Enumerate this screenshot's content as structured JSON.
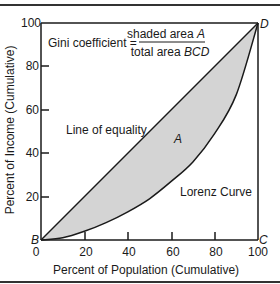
{
  "chart_data": {
    "type": "area",
    "title": "",
    "xlabel": "Percent of Population (Cumulative)",
    "ylabel": "Percent of Income (Cumulative)",
    "xlim": [
      0,
      100
    ],
    "ylim": [
      0,
      100
    ],
    "x_ticks": [
      "0",
      "20",
      "40",
      "60",
      "80",
      "100"
    ],
    "y_ticks": [
      "20",
      "40",
      "60",
      "80",
      "100"
    ],
    "grid": false,
    "legend": "none",
    "series": [
      {
        "name": "Line of equality",
        "x": [
          0,
          100
        ],
        "y": [
          0,
          100
        ]
      },
      {
        "name": "Lorenz Curve",
        "x": [
          0,
          10,
          20,
          30,
          40,
          50,
          60,
          70,
          80,
          90,
          100
        ],
        "y": [
          0,
          1,
          4,
          8,
          13,
          19,
          27,
          36,
          49,
          67,
          100
        ]
      }
    ],
    "shaded_region": {
      "label": "A",
      "between": [
        "Line of equality",
        "Lorenz Curve"
      ],
      "color": "#d4d4d4"
    },
    "corner_labels": {
      "B": [
        0,
        0
      ],
      "C": [
        100,
        0
      ],
      "D": [
        100,
        100
      ]
    },
    "annotations": [
      "Gini coefficient = shaded area A / total area BCD",
      "Line of equality",
      "A",
      "Lorenz Curve"
    ]
  },
  "formula": {
    "lhs": "Gini coefficient =",
    "numerator": "shaded area ",
    "numerator_var": "A",
    "denominator": "total area ",
    "denominator_var": "BCD"
  },
  "labels": {
    "line_of_equality": "Line of equality",
    "area": "A",
    "lorenz": "Lorenz Curve",
    "corner_b": "B",
    "corner_c": "C",
    "corner_d": "D"
  },
  "axes": {
    "xlabel": "Percent of Population (Cumulative)",
    "ylabel": "Percent of Income (Cumulative)",
    "x_ticks": [
      "0",
      "20",
      "40",
      "60",
      "80",
      "100"
    ],
    "y_ticks": [
      "20",
      "40",
      "60",
      "80",
      "100"
    ]
  },
  "colors": {
    "shade": "#d4d4d4",
    "line": "#1a1a1a"
  }
}
